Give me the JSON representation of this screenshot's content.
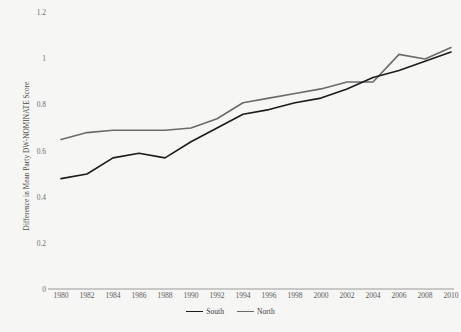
{
  "chart_data": {
    "type": "line",
    "title": "",
    "subtitle": "",
    "xlabel": "",
    "ylabel": "Difference in Mean Party DW-NOMINATE Score",
    "x": [
      1980,
      1982,
      1984,
      1986,
      1988,
      1990,
      1992,
      1994,
      1996,
      1998,
      2000,
      2002,
      2004,
      2006,
      2008,
      2010
    ],
    "xtick_labels": [
      "1980",
      "1982",
      "1984",
      "1986",
      "1988",
      "1990",
      "1992",
      "1994",
      "1996",
      "1998",
      "2000",
      "2002",
      "2004",
      "2006",
      "2008",
      "2010"
    ],
    "ytick_labels": [
      "0",
      "0.2",
      "0.4",
      "0.6",
      "0.8",
      "1",
      "1.2"
    ],
    "ytick_values": [
      0,
      0.2,
      0.4,
      0.6,
      0.8,
      1,
      1.2
    ],
    "xlim": [
      1980,
      2010
    ],
    "ylim": [
      0,
      1.2
    ],
    "grid": false,
    "legend_position": "bottom-center",
    "series": [
      {
        "name": "South",
        "color": "#1c1c1c",
        "values": [
          0.48,
          0.5,
          0.57,
          0.59,
          0.57,
          0.64,
          0.7,
          0.76,
          0.78,
          0.81,
          0.83,
          0.87,
          0.92,
          0.95,
          0.99,
          1.03
        ]
      },
      {
        "name": "North",
        "color": "#6b6b6b",
        "values": [
          0.65,
          0.68,
          0.69,
          0.69,
          0.69,
          0.7,
          0.74,
          0.81,
          0.83,
          0.85,
          0.87,
          0.9,
          0.9,
          1.02,
          1.0,
          1.05
        ]
      }
    ]
  },
  "axes": {
    "y_title": "Difference in Mean Party DW-NOMINATE Score",
    "y_ticks": [
      "1.2",
      "1",
      "0.8",
      "0.6",
      "0.4",
      "0.2",
      "0"
    ],
    "x_ticks": [
      "1980",
      "1982",
      "1984",
      "1986",
      "1988",
      "1990",
      "1992",
      "1994",
      "1996",
      "1998",
      "2000",
      "2002",
      "2004",
      "2006",
      "2008",
      "2010"
    ]
  },
  "legend": {
    "items": [
      {
        "label": "South",
        "color": "#1c1c1c"
      },
      {
        "label": "North",
        "color": "#6b6b6b"
      }
    ]
  },
  "colors": {
    "background": "#f6f6f4",
    "axis_line": "#9a9a9a",
    "tick_text": "#5a5a5a",
    "south_line": "#1c1c1c",
    "north_line": "#6b6b6b"
  }
}
